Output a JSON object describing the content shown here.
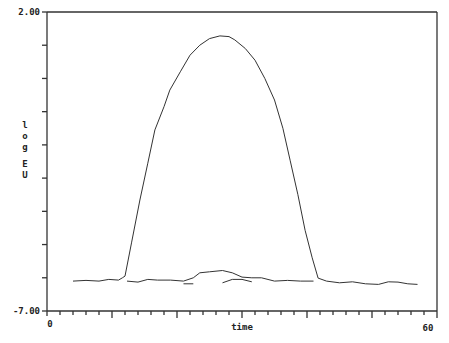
{
  "chart_data": {
    "type": "line",
    "title": "",
    "xlabel": "time",
    "ylabel": "log EU",
    "xlim": [
      0,
      60
    ],
    "ylim": [
      -7.0,
      2.0
    ],
    "x_tick_labels": [
      "0",
      "60"
    ],
    "y_tick_labels": [
      "2.00",
      "-7.00"
    ],
    "x_minor_tick_step": 2,
    "x_major_tick_step": 10,
    "y_tick_step": 1,
    "grid": false,
    "legend": null,
    "series": [
      {
        "name": "main-response",
        "x": [
          4,
          6,
          8,
          9.5,
          11,
          11.6,
          12,
          13,
          14.3,
          15.5,
          16.6,
          18,
          18.9,
          20.5,
          22,
          23.5,
          25,
          26.6,
          28,
          28.9,
          30.5,
          32,
          33.5,
          35,
          36.3,
          37.4,
          38.6,
          39.7,
          40.8,
          41.7
        ],
        "y": [
          -6.1,
          -6.08,
          -6.1,
          -6.05,
          -6.07,
          -6.0,
          -5.95,
          -4.95,
          -3.66,
          -2.55,
          -1.55,
          -0.85,
          -0.35,
          0.2,
          0.7,
          1.0,
          1.2,
          1.28,
          1.26,
          1.16,
          0.9,
          0.55,
          0.0,
          -0.65,
          -1.5,
          -2.46,
          -3.5,
          -4.57,
          -5.4,
          -6.01
        ]
      },
      {
        "name": "baseline-after",
        "x": [
          41.7,
          43,
          45,
          47,
          49,
          51,
          52.5,
          54,
          55.5,
          57
        ],
        "y": [
          -6.01,
          -6.1,
          -6.15,
          -6.12,
          -6.18,
          -6.2,
          -6.12,
          -6.13,
          -6.18,
          -6.2
        ]
      },
      {
        "name": "lower-trace",
        "x": [
          12.3,
          14,
          15.5,
          17,
          19,
          21,
          22.5,
          23.5,
          25,
          27,
          28.5,
          30,
          31.5,
          33,
          35,
          37,
          39,
          41
        ],
        "y": [
          -6.1,
          -6.13,
          -6.05,
          -6.07,
          -6.07,
          -6.1,
          -6.0,
          -5.85,
          -5.82,
          -5.78,
          -5.85,
          -5.98,
          -6.0,
          -6.0,
          -6.1,
          -6.08,
          -6.1,
          -6.1
        ]
      },
      {
        "name": "lower-dash-1",
        "x": [
          21,
          22.5
        ],
        "y": [
          -6.18,
          -6.18
        ]
      },
      {
        "name": "lower-dash-2",
        "x": [
          27,
          28.5,
          30,
          31.5
        ],
        "y": [
          -6.15,
          -6.05,
          -6.05,
          -6.12
        ]
      }
    ]
  },
  "axes": {
    "y_top_label": "2.00",
    "y_bottom_label": "-7.00",
    "x_left_label": "0",
    "x_right_label": "60",
    "x_title": "time",
    "y_title_chars": [
      "l",
      "o",
      "g",
      "",
      "E",
      "U"
    ]
  }
}
